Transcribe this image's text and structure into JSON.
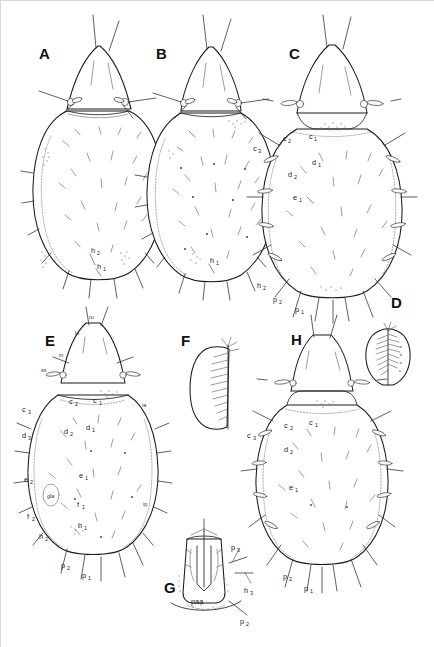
{
  "plate": {
    "title": "Comparative morphology plate of mite idiosoma and gnathosoma",
    "background_color": "#ffffff",
    "ink_color": "#1b1b1b",
    "panel_count": 8
  },
  "panels": [
    {
      "id": "A",
      "letter": "A",
      "view": "dorsal habitus, anterior prodorsum and idiosoma",
      "labels": [
        {
          "base": "h",
          "sub": "2"
        },
        {
          "base": "h",
          "sub": "1"
        }
      ]
    },
    {
      "id": "B",
      "letter": "B",
      "view": "dorsal habitus, idiosoma with sparse setae",
      "labels": [
        {
          "base": "h",
          "sub": "1"
        }
      ]
    },
    {
      "id": "C",
      "letter": "C",
      "view": "dorsal habitus with elongate marginal setae",
      "labels": [
        {
          "base": "c",
          "sub": "3"
        },
        {
          "base": "c",
          "sub": "2"
        },
        {
          "base": "c",
          "sub": "1"
        },
        {
          "base": "d",
          "sub": "1"
        },
        {
          "base": "d",
          "sub": "2"
        },
        {
          "base": "e",
          "sub": "1"
        },
        {
          "base": "h",
          "sub": "2"
        },
        {
          "base": "p",
          "sub": "2"
        },
        {
          "base": "p",
          "sub": "1"
        }
      ]
    },
    {
      "id": "D",
      "letter": "D",
      "view": "detail of pectinate solenidion / sensillum",
      "labels": []
    },
    {
      "id": "E",
      "letter": "E",
      "view": "dorsal habitus, fully annotated chaetotaxy",
      "labels": [
        {
          "base": "ro",
          "sub": ""
        },
        {
          "base": "le",
          "sub": ""
        },
        {
          "base": "in",
          "sub": ""
        },
        {
          "base": "ss",
          "sub": ""
        },
        {
          "base": "c",
          "sub": "3"
        },
        {
          "base": "c",
          "sub": "2"
        },
        {
          "base": "c",
          "sub": "1"
        },
        {
          "base": "ia",
          "sub": ""
        },
        {
          "base": "d",
          "sub": "3"
        },
        {
          "base": "d",
          "sub": "2"
        },
        {
          "base": "d",
          "sub": "1"
        },
        {
          "base": "e",
          "sub": "2"
        },
        {
          "base": "e",
          "sub": "1"
        },
        {
          "base": "gla",
          "sub": ""
        },
        {
          "base": "f",
          "sub": "2"
        },
        {
          "base": "f",
          "sub": "1"
        },
        {
          "base": "h",
          "sub": "2"
        },
        {
          "base": "h",
          "sub": "1"
        },
        {
          "base": "ip",
          "sub": ""
        },
        {
          "base": "p",
          "sub": "2"
        },
        {
          "base": "p",
          "sub": "1"
        }
      ]
    },
    {
      "id": "F",
      "letter": "F",
      "view": "lateral detail of pectinate seta",
      "labels": []
    },
    {
      "id": "G",
      "letter": "G",
      "view": "ventral gnathosoma / subcapitulum and anal region",
      "labels": [
        {
          "base": "p",
          "sub": "3"
        },
        {
          "base": "h",
          "sub": "3"
        },
        {
          "base": "paa",
          "sub": ""
        },
        {
          "base": "p",
          "sub": "2"
        }
      ]
    },
    {
      "id": "H",
      "letter": "H",
      "view": "dorsal habitus with long marginal setae",
      "labels": [
        {
          "base": "c",
          "sub": "3"
        },
        {
          "base": "c",
          "sub": "2"
        },
        {
          "base": "c",
          "sub": "1"
        },
        {
          "base": "d",
          "sub": "2"
        },
        {
          "base": "e",
          "sub": "1"
        },
        {
          "base": "p",
          "sub": "2"
        },
        {
          "base": "p",
          "sub": "1"
        }
      ]
    }
  ],
  "text_nodes": {
    "A": "A",
    "B": "B",
    "C": "C",
    "D": "D",
    "E": "E",
    "F": "F",
    "G": "G",
    "H": "H",
    "c1": "c",
    "c2": "c",
    "c3": "c",
    "d1": "d",
    "d2": "d",
    "d3": "d",
    "e1": "e",
    "e2": "e",
    "f1": "f",
    "f2": "f",
    "h1": "h",
    "h2": "h",
    "h3": "h",
    "p1": "p",
    "p2": "p",
    "p3": "p",
    "ro": "ro",
    "le": "le",
    "in": "in",
    "ss": "ss",
    "ia": "ia",
    "ip": "ip",
    "gla": "gla",
    "paa": "paa",
    "s1": "1",
    "s2": "2",
    "s3": "3"
  }
}
